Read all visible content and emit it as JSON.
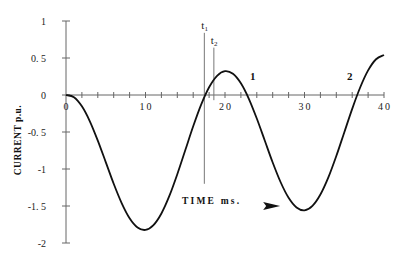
{
  "chart_data": {
    "type": "line",
    "title": "",
    "xlabel": "TIME ms.",
    "ylabel": "CURRENT p.u.",
    "xlim": [
      0,
      40
    ],
    "ylim": [
      -2,
      1
    ],
    "x_ticks_labeled": [
      0,
      10,
      20,
      30,
      40
    ],
    "x_minor_tick_step": 2,
    "y_ticks": [
      1,
      0.5,
      0,
      -0.5,
      -1,
      -1.5,
      -2
    ],
    "y_tick_labels": [
      "1",
      "0.5",
      "0",
      "-0.5",
      "-1",
      "-1.5",
      "-2"
    ],
    "grid": false,
    "legend": null,
    "series": [
      {
        "name": "current",
        "x": [
          0,
          1,
          2,
          3,
          4,
          5,
          6,
          7,
          8,
          9,
          10,
          11,
          12,
          13,
          14,
          15,
          16,
          17,
          18,
          19,
          20,
          21,
          22,
          23,
          24,
          25,
          26,
          27,
          28,
          29,
          30,
          31,
          32,
          33,
          34,
          35,
          36,
          37,
          38,
          39,
          40
        ],
        "y": [
          0,
          -0.03,
          -0.153,
          -0.355,
          -0.616,
          -0.907,
          -1.199,
          -1.46,
          -1.665,
          -1.79,
          -1.823,
          -1.758,
          -1.601,
          -1.364,
          -1.07,
          -0.747,
          -0.423,
          -0.13,
          0.105,
          0.26,
          0.323,
          0.287,
          0.158,
          -0.051,
          -0.318,
          -0.615,
          -0.912,
          -1.179,
          -1.389,
          -1.52,
          -1.558,
          -1.498,
          -1.345,
          -1.114,
          -0.825,
          -0.506,
          -0.187,
          0.101,
          0.332,
          0.483,
          0.541
        ]
      }
    ],
    "vertical_markers": [
      {
        "label": "t",
        "subscript": "1",
        "x": 17.4,
        "y_top": 0.84,
        "y_bottom": -1.2
      },
      {
        "label": "t",
        "subscript": "2",
        "x": 18.6,
        "y_top": 0.64,
        "y_bottom": -0.07
      }
    ],
    "annotations": [
      {
        "text": "1",
        "x": 23.5,
        "y": 0.2
      },
      {
        "text": "2",
        "x": 35.7,
        "y": 0.2
      }
    ],
    "arrow": {
      "direction": "right",
      "x": 24.8,
      "y": -1.4
    }
  }
}
